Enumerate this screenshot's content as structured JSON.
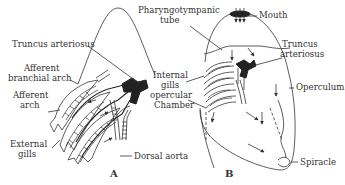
{
  "diagram": {
    "panel_a": {
      "letter": "A",
      "labels": {
        "truncus_arteriosus": "Truncus arteriosus",
        "afferent_branchial_arch_1": "Afferent",
        "afferent_branchial_arch_2": "branchial arch",
        "afferent_arch_1": "Afferent",
        "afferent_arch_2": "arch",
        "external_gills_1": "External",
        "external_gills_2": "gills",
        "dorsal_aorta": "Dorsal aorta"
      }
    },
    "panel_b": {
      "letter": "B",
      "labels": {
        "pharyngotympanic_tube_1": "Pharyngotympanic",
        "pharyngotympanic_tube_2": "tube",
        "mouth": "Mouth",
        "truncus_arteriosus_1": "Truncus",
        "truncus_arteriosus_2": "arteriosus",
        "internal_gills_1": "Internal",
        "internal_gills_2": "gills",
        "opercular_chamber_1": "opercular",
        "opercular_chamber_2": "Chamber",
        "operculum": "Operculum",
        "spiracle": "Spiracle"
      }
    }
  }
}
